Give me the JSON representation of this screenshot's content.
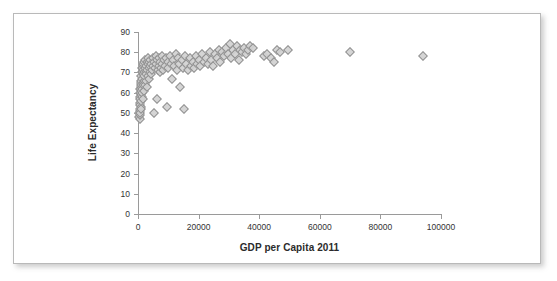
{
  "figure": {
    "name": "gdp-life-expectancy-scatter",
    "background": "#ffffff",
    "border_color": "#b9b9b9"
  },
  "chart_data": {
    "type": "scatter",
    "title": "",
    "xlabel": "GDP per Capita 2011",
    "ylabel": "Life Expectancy",
    "xlim": [
      0,
      100000
    ],
    "ylim": [
      0,
      90
    ],
    "xticks": [
      0,
      20000,
      40000,
      60000,
      80000,
      100000
    ],
    "xtick_labels": [
      "0",
      "20000",
      "40000",
      "60000",
      "80000",
      "100000"
    ],
    "yticks": [
      0,
      10,
      20,
      30,
      40,
      50,
      60,
      70,
      80,
      90
    ],
    "ytick_labels": [
      "0",
      "10",
      "20",
      "30",
      "40",
      "50",
      "60",
      "70",
      "80",
      "90"
    ],
    "grid": false,
    "legend": false,
    "marker": {
      "shape": "diamond",
      "fill": "#d2d2d2",
      "edge": "#8b8b8b",
      "size_px": 7
    },
    "series": [
      {
        "name": "Countries",
        "points": [
          [
            400,
            48
          ],
          [
            450,
            50
          ],
          [
            500,
            47
          ],
          [
            550,
            52
          ],
          [
            600,
            49
          ],
          [
            620,
            55
          ],
          [
            650,
            51
          ],
          [
            700,
            58
          ],
          [
            720,
            54
          ],
          [
            750,
            60
          ],
          [
            780,
            50
          ],
          [
            800,
            62
          ],
          [
            820,
            57
          ],
          [
            850,
            53
          ],
          [
            880,
            63
          ],
          [
            900,
            59
          ],
          [
            930,
            65
          ],
          [
            950,
            56
          ],
          [
            980,
            61
          ],
          [
            1000,
            66
          ],
          [
            1050,
            52
          ],
          [
            1100,
            64
          ],
          [
            1150,
            68
          ],
          [
            1200,
            58
          ],
          [
            1250,
            70
          ],
          [
            1300,
            62
          ],
          [
            1350,
            67
          ],
          [
            1400,
            72
          ],
          [
            1450,
            60
          ],
          [
            1500,
            69
          ],
          [
            1550,
            65
          ],
          [
            1600,
            73
          ],
          [
            1650,
            57
          ],
          [
            1700,
            71
          ],
          [
            1750,
            64
          ],
          [
            1800,
            74
          ],
          [
            1850,
            66
          ],
          [
            1900,
            70
          ],
          [
            1950,
            61
          ],
          [
            2000,
            75
          ],
          [
            2100,
            68
          ],
          [
            2200,
            72
          ],
          [
            2300,
            64
          ],
          [
            2400,
            76
          ],
          [
            2500,
            70
          ],
          [
            2600,
            66
          ],
          [
            2700,
            73
          ],
          [
            2800,
            69
          ],
          [
            2900,
            75
          ],
          [
            3000,
            71
          ],
          [
            3100,
            63
          ],
          [
            3200,
            74
          ],
          [
            3300,
            68
          ],
          [
            3400,
            77
          ],
          [
            3500,
            72
          ],
          [
            3600,
            67
          ],
          [
            3700,
            75
          ],
          [
            3800,
            70
          ],
          [
            3900,
            73
          ],
          [
            4000,
            76
          ],
          [
            4200,
            69
          ],
          [
            4400,
            74
          ],
          [
            4600,
            71
          ],
          [
            4800,
            77
          ],
          [
            5000,
            73
          ],
          [
            5200,
            50
          ],
          [
            5400,
            75
          ],
          [
            5600,
            72
          ],
          [
            5800,
            78
          ],
          [
            6000,
            74
          ],
          [
            6200,
            57
          ],
          [
            6400,
            76
          ],
          [
            6600,
            71
          ],
          [
            6800,
            73
          ],
          [
            7000,
            77
          ],
          [
            7200,
            70
          ],
          [
            7400,
            75
          ],
          [
            7600,
            72
          ],
          [
            7800,
            78
          ],
          [
            8000,
            74
          ],
          [
            8300,
            71
          ],
          [
            8600,
            76
          ],
          [
            8900,
            73
          ],
          [
            9200,
            77
          ],
          [
            9500,
            53
          ],
          [
            9800,
            75
          ],
          [
            10000,
            72
          ],
          [
            10400,
            78
          ],
          [
            10800,
            74
          ],
          [
            11200,
            67
          ],
          [
            11600,
            76
          ],
          [
            12000,
            73
          ],
          [
            12400,
            79
          ],
          [
            12800,
            71
          ],
          [
            13200,
            77
          ],
          [
            13600,
            74
          ],
          [
            14000,
            63
          ],
          [
            14400,
            76
          ],
          [
            14800,
            72
          ],
          [
            15200,
            52
          ],
          [
            15600,
            78
          ],
          [
            16000,
            74
          ],
          [
            16500,
            71
          ],
          [
            17000,
            77
          ],
          [
            17500,
            73
          ],
          [
            18000,
            75
          ],
          [
            18500,
            72
          ],
          [
            19000,
            78
          ],
          [
            19500,
            74
          ],
          [
            20000,
            76
          ],
          [
            20600,
            73
          ],
          [
            21200,
            79
          ],
          [
            21800,
            75
          ],
          [
            22400,
            77
          ],
          [
            23000,
            74
          ],
          [
            23600,
            80
          ],
          [
            24200,
            76
          ],
          [
            24800,
            73
          ],
          [
            25400,
            79
          ],
          [
            26000,
            77
          ],
          [
            26600,
            81
          ],
          [
            27200,
            75
          ],
          [
            27800,
            80
          ],
          [
            28400,
            78
          ],
          [
            29000,
            82
          ],
          [
            29600,
            79
          ],
          [
            30200,
            84
          ],
          [
            30800,
            77
          ],
          [
            31400,
            81
          ],
          [
            32000,
            79
          ],
          [
            32600,
            83
          ],
          [
            33200,
            76
          ],
          [
            33800,
            81
          ],
          [
            34400,
            80
          ],
          [
            35000,
            82
          ],
          [
            35600,
            79
          ],
          [
            36200,
            81
          ],
          [
            37000,
            83
          ],
          [
            37800,
            82
          ],
          [
            41500,
            78
          ],
          [
            42500,
            79
          ],
          [
            44000,
            77
          ],
          [
            44800,
            75
          ],
          [
            46000,
            81
          ],
          [
            47000,
            80
          ],
          [
            49500,
            81
          ],
          [
            70000,
            80
          ],
          [
            94000,
            78
          ]
        ]
      }
    ]
  }
}
